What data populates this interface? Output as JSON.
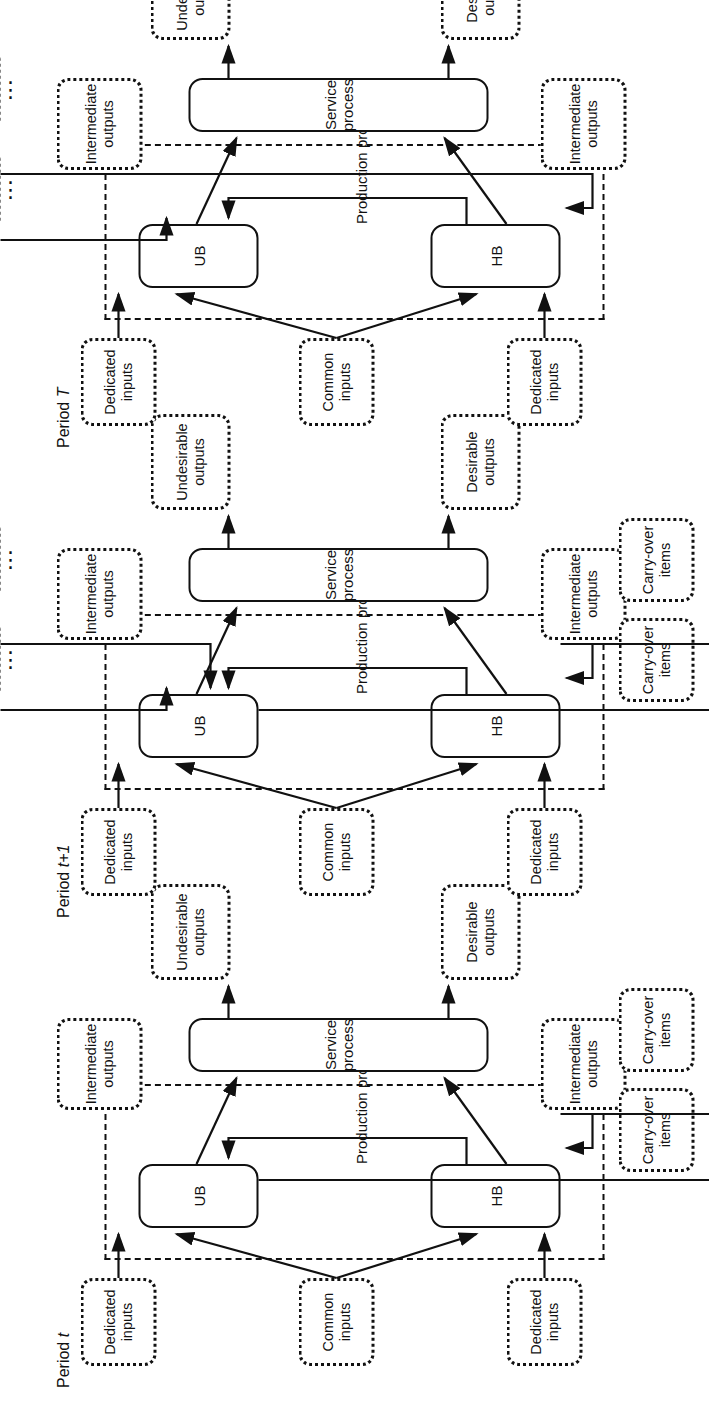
{
  "figure": {
    "type": "diagram",
    "orientation": "rotated-90-ccw"
  },
  "labels": {
    "common_inputs": "Common inputs",
    "dedicated_inputs": "Dedicated inputs",
    "hb": "HB",
    "ub": "UB",
    "production_process": "Production process",
    "service_process": "Service process",
    "intermediate_outputs": "Intermediate outputs",
    "carry_over_items": "Carry-over items",
    "desirable_outputs": "Desirable outputs",
    "undesirable_outputs": "Undesirable outputs",
    "ellipsis": "⋮"
  },
  "periods": [
    {
      "id": "period-t",
      "title_prefix": "Period ",
      "title_symbol": "t"
    },
    {
      "id": "period-t-plus-1",
      "title_prefix": "Period ",
      "title_symbol": "t+1"
    },
    {
      "id": "period-T",
      "title_prefix": "Period ",
      "title_symbol": "T"
    }
  ],
  "colors": {
    "stroke": "#111111",
    "background": "#ffffff"
  }
}
